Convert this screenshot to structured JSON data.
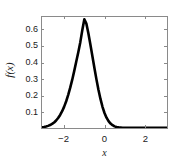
{
  "chart_data": {
    "type": "line",
    "title": "",
    "subtitle": "",
    "xlabel": "x",
    "ylabel": "f(x)",
    "xlim": [
      -3.1,
      3.1
    ],
    "ylim": [
      0,
      0.68
    ],
    "grid": false,
    "legend": null,
    "xticks": [
      -2,
      0,
      2
    ],
    "xticklabels": [
      "−2",
      "0",
      "2"
    ],
    "yticks": [
      0.1,
      0.2,
      0.3,
      0.4,
      0.5,
      0.6
    ],
    "yticklabels": [
      "0.1",
      "0.2",
      "0.3",
      "0.4",
      "0.5",
      "0.6"
    ],
    "series": [
      {
        "name": "f(x)",
        "color": "#000000",
        "linewidth": 2.6,
        "x": [
          -3.1,
          -3.0,
          -2.9,
          -2.8,
          -2.7,
          -2.6,
          -2.5,
          -2.4,
          -2.3,
          -2.2,
          -2.1,
          -2.0,
          -1.9,
          -1.8,
          -1.7,
          -1.6,
          -1.5,
          -1.4,
          -1.3,
          -1.2,
          -1.1,
          -1.0,
          -0.9,
          -0.8,
          -0.7,
          -0.6,
          -0.5,
          -0.4,
          -0.3,
          -0.2,
          -0.1,
          0.0,
          0.1,
          0.2,
          0.3,
          0.4,
          0.5,
          0.6,
          0.7,
          0.8,
          0.9,
          1.0,
          1.2,
          1.4,
          1.6,
          1.8,
          2.0,
          2.2,
          2.4,
          2.6,
          2.8,
          3.0,
          3.1
        ],
        "y": [
          0.004,
          0.006,
          0.009,
          0.013,
          0.018,
          0.025,
          0.034,
          0.046,
          0.061,
          0.08,
          0.103,
          0.131,
          0.164,
          0.203,
          0.247,
          0.296,
          0.35,
          0.407,
          0.464,
          0.526,
          0.6,
          0.666,
          0.64,
          0.58,
          0.512,
          0.44,
          0.368,
          0.298,
          0.234,
          0.178,
          0.13,
          0.092,
          0.063,
          0.042,
          0.027,
          0.017,
          0.01,
          0.006,
          0.004,
          0.003,
          0.002,
          0.001,
          0.001,
          0.001,
          0.001,
          0.001,
          0.001,
          0.001,
          0.001,
          0.001,
          0.001,
          0.001,
          0.001
        ]
      }
    ],
    "peak": {
      "x": -1.0,
      "y": 0.666
    },
    "colors": {
      "line": "#000000",
      "axis": "#8a8a8a",
      "text": "#1a1a1a",
      "background": "#ffffff"
    }
  },
  "axis": {
    "x_label": "x",
    "y_label": "f(x)",
    "x_tick_labels": [
      "−2",
      "0",
      "2"
    ],
    "y_tick_labels": [
      "0.6",
      "0.5",
      "0.4",
      "0.3",
      "0.2",
      "0.1"
    ]
  }
}
